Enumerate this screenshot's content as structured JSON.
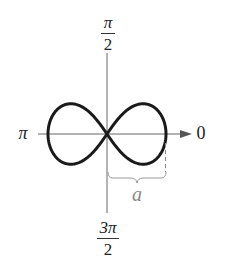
{
  "diagram": {
    "labels": {
      "top": {
        "numerator": "π",
        "denominator": "2"
      },
      "bottom": {
        "numerator": "3π",
        "denominator": "2"
      },
      "left": "π",
      "right": "0",
      "length": "a"
    },
    "colors": {
      "curve": "#1a1a1a",
      "axis": "#555555",
      "brace": "#999999",
      "length_label": "#888888",
      "text": "#222222"
    },
    "geometry": {
      "origin": [
        107,
        134
      ],
      "half_width_a": 59,
      "curve": "lemniscate r^2 = a^2 cos(2θ)"
    }
  }
}
